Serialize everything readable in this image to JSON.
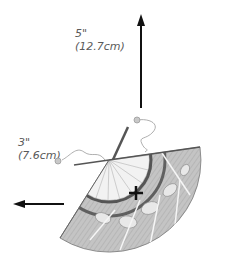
{
  "dimensions": {
    "vertical": {
      "inches": "5\"",
      "cm": "(12.7cm)"
    },
    "horizontal": {
      "inches": "3\"",
      "cm": "(7.6cm)"
    }
  },
  "colors": {
    "arrow": "#111111",
    "label_text": "#5a5a5a",
    "fan_fill": "#bdbdbd",
    "fan_band": "#555555",
    "fan_inner": "#f2f2f2"
  },
  "icons": {
    "up_arrow": "arrow-up",
    "left_arrow": "arrow-left",
    "center_mark": "plus"
  }
}
